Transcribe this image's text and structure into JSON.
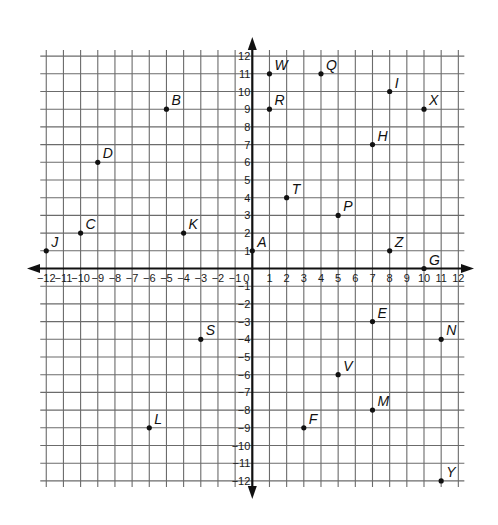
{
  "chart_data": {
    "type": "scatter",
    "title": "",
    "xlabel": "",
    "ylabel": "",
    "xlim": [
      -12,
      12
    ],
    "ylim": [
      -12,
      12
    ],
    "grid": true,
    "legend": null,
    "x_ticks": [
      -12,
      -11,
      -10,
      -9,
      -8,
      -7,
      -6,
      -5,
      -4,
      -3,
      -2,
      -1,
      0,
      1,
      2,
      3,
      4,
      5,
      6,
      7,
      8,
      9,
      10,
      11,
      12
    ],
    "y_ticks": [
      -12,
      -11,
      -10,
      -9,
      -8,
      -7,
      -6,
      -5,
      -4,
      -3,
      -2,
      -1,
      1,
      2,
      3,
      4,
      5,
      6,
      7,
      8,
      9,
      10,
      11,
      12
    ],
    "points": [
      {
        "label": "A",
        "x": 0,
        "y": 1
      },
      {
        "label": "B",
        "x": -5,
        "y": 9
      },
      {
        "label": "C",
        "x": -10,
        "y": 2
      },
      {
        "label": "D",
        "x": -9,
        "y": 6
      },
      {
        "label": "E",
        "x": 7,
        "y": -3
      },
      {
        "label": "F",
        "x": 3,
        "y": -9
      },
      {
        "label": "G",
        "x": 10,
        "y": 0
      },
      {
        "label": "H",
        "x": 7,
        "y": 7
      },
      {
        "label": "I",
        "x": 8,
        "y": 10
      },
      {
        "label": "J",
        "x": -12,
        "y": 1
      },
      {
        "label": "K",
        "x": -4,
        "y": 2
      },
      {
        "label": "L",
        "x": -6,
        "y": -9
      },
      {
        "label": "M",
        "x": 7,
        "y": -8
      },
      {
        "label": "N",
        "x": 11,
        "y": -4
      },
      {
        "label": "P",
        "x": 5,
        "y": 3
      },
      {
        "label": "Q",
        "x": 4,
        "y": 11
      },
      {
        "label": "R",
        "x": 1,
        "y": 9
      },
      {
        "label": "S",
        "x": -3,
        "y": -4
      },
      {
        "label": "T",
        "x": 2,
        "y": 4
      },
      {
        "label": "V",
        "x": 5,
        "y": -6
      },
      {
        "label": "W",
        "x": 1,
        "y": 11
      },
      {
        "label": "X",
        "x": 10,
        "y": 9
      },
      {
        "label": "Y",
        "x": 11,
        "y": -12
      },
      {
        "label": "Z",
        "x": 8,
        "y": 1
      }
    ]
  },
  "colors": {
    "background": "#ffffff",
    "grid": "#6b6b6b",
    "axis": "#111111",
    "point": "#111111"
  }
}
